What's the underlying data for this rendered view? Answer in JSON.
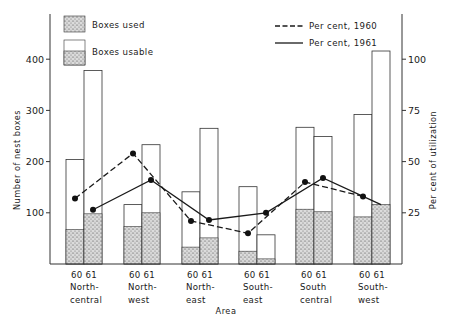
{
  "chart_data": {
    "type": "bar",
    "title": "",
    "xlabel": "Area",
    "ylabel": "Number of nest boxes",
    "y2label": "Per cent of utilization",
    "ylim": [
      0,
      500
    ],
    "y2lim": [
      0,
      125
    ],
    "yticks": [
      100,
      200,
      300,
      400
    ],
    "y2ticks": [
      25,
      50,
      75,
      100
    ],
    "grid": false,
    "legend_position": "top",
    "categories": [
      "North-central",
      "North-west",
      "North-east",
      "South-east",
      "South central",
      "South-west"
    ],
    "category_label_lines": [
      [
        "North-",
        "central"
      ],
      [
        "North-",
        "west"
      ],
      [
        "North-",
        "east"
      ],
      [
        "South-",
        "east"
      ],
      [
        "South",
        "central"
      ],
      [
        "South-",
        "west"
      ]
    ],
    "year_labels": [
      "60",
      "61"
    ],
    "series": [
      {
        "name": "Boxes usable",
        "year": "1960",
        "type": "bar",
        "values": [
          204,
          116,
          141,
          151,
          267,
          292
        ]
      },
      {
        "name": "Boxes used",
        "year": "1960",
        "type": "bar",
        "values": [
          67,
          73,
          33,
          25,
          107,
          92
        ]
      },
      {
        "name": "Boxes usable",
        "year": "1961",
        "type": "bar",
        "values": [
          378,
          233,
          265,
          57,
          249,
          416
        ]
      },
      {
        "name": "Boxes used",
        "year": "1961",
        "type": "bar",
        "values": [
          98,
          100,
          51,
          10,
          102,
          116
        ]
      },
      {
        "name": "Per cent, 1960",
        "type": "line",
        "axis": "right",
        "style": "dashed",
        "values": [
          32,
          54,
          21,
          15,
          40,
          33
        ]
      },
      {
        "name": "Per cent, 1961",
        "type": "line",
        "axis": "right",
        "style": "solid",
        "values": [
          26.5,
          41,
          21.5,
          25,
          42,
          29
        ]
      }
    ],
    "legend": [
      {
        "label": "Boxes used",
        "swatch": "stippled"
      },
      {
        "label": "Boxes usable",
        "swatch": "open-over-stippled"
      },
      {
        "label": "Per cent, 1960",
        "swatch": "dashed-line"
      },
      {
        "label": "Per cent, 1961",
        "swatch": "solid-line"
      }
    ]
  },
  "colors": {
    "ink": "#1a1a1a",
    "stipple_bg": "#d8d8d8",
    "background": "#ffffff"
  }
}
